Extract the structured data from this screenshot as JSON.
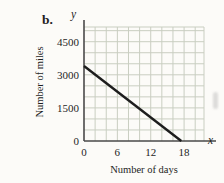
{
  "figure": {
    "item_label": "b."
  },
  "chart_data": {
    "type": "line",
    "title": "",
    "xlabel": "Number of days",
    "ylabel": "Number of miles",
    "x_axis_symbol": "x",
    "y_axis_symbol": "y",
    "x_ticks": [
      0,
      6,
      12,
      18
    ],
    "y_ticks": [
      0,
      1500,
      3000,
      4500
    ],
    "xlim": [
      0,
      21.5
    ],
    "ylim": [
      0,
      5200
    ],
    "grid": {
      "on": true,
      "x_minor_step": 2,
      "y_minor_step": 500,
      "color": "#c9cec1"
    },
    "legend": "none",
    "axis_color": "#4a4a4a",
    "line_color": "#1d1d1d",
    "series": [
      {
        "name": "miles-remaining-line",
        "points": [
          [
            0,
            3400
          ],
          [
            17.5,
            0
          ]
        ],
        "y_intercept": 3400,
        "x_intercept": 17.5
      }
    ]
  }
}
